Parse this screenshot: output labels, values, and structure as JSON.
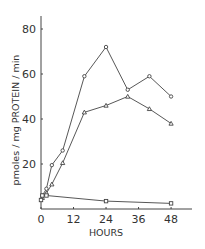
{
  "chart_data": {
    "type": "line",
    "title": "",
    "xlabel": "HOURS",
    "ylabel": "pmoles / mg PROTEIN / min",
    "xlim": [
      0,
      54
    ],
    "ylim": [
      0,
      85
    ],
    "x_ticks": [
      0,
      12,
      24,
      36,
      48
    ],
    "x_tick_labels": [
      "0",
      "12",
      "24",
      "36",
      "48"
    ],
    "y_ticks": [
      20,
      40,
      60,
      80
    ],
    "y_tick_labels": [
      "20",
      "40",
      "60",
      "80"
    ],
    "grid": false,
    "legend": null,
    "series": [
      {
        "name": "circles",
        "marker": "circle",
        "x": [
          0.5,
          2,
          4,
          8,
          16,
          24,
          32,
          40,
          48
        ],
        "y": [
          6,
          9,
          19.5,
          26,
          59,
          72,
          53,
          59,
          50
        ]
      },
      {
        "name": "triangles",
        "marker": "triangle",
        "x": [
          0.5,
          2,
          4,
          8,
          16,
          24,
          32,
          40,
          48
        ],
        "y": [
          5,
          7,
          11,
          20.5,
          43,
          46,
          50,
          44.5,
          38
        ]
      },
      {
        "name": "squares",
        "marker": "square",
        "x": [
          0,
          0.5,
          2,
          24,
          48
        ],
        "y": [
          4,
          6,
          6,
          3.5,
          2.5
        ]
      }
    ]
  }
}
